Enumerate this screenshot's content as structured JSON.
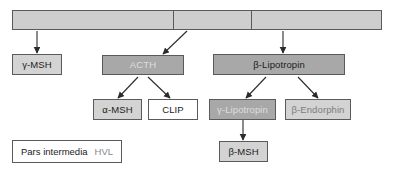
{
  "figure": {
    "background": "#ffffff",
    "border_color": "#5a5a5a"
  },
  "precursor_bar": {
    "name": "pomc-precursor-bar",
    "fill": "#cecece",
    "segments": [
      {
        "label": ""
      },
      {
        "label": ""
      },
      {
        "label": ""
      }
    ]
  },
  "nodes": {
    "gamma_msh": {
      "label": "γ-MSH",
      "fill": "#d3d3d3",
      "text": "#1c1c1c"
    },
    "acth": {
      "label": "ACTH",
      "fill": "#a8a8a8",
      "text": "#dedede"
    },
    "beta_lipotropin": {
      "label": "β-Lipotropin",
      "fill": "#a8a8a8",
      "text": "#1c1c1c"
    },
    "alpha_msh": {
      "label": "α-MSH",
      "fill": "#d3d3d3",
      "text": "#1c1c1c"
    },
    "clip": {
      "label": "CLIP",
      "fill": "#ffffff",
      "text": "#1c1c1c"
    },
    "gamma_lipotropin": {
      "label": "γ-Lipotropin",
      "fill": "#a8a8a8",
      "text": "#dedede"
    },
    "beta_endorphin": {
      "label": "β-Endorphin",
      "fill": "#d3d3d3",
      "text": "#7d7d7d"
    },
    "beta_msh": {
      "label": "β-MSH",
      "fill": "#d3d3d3",
      "text": "#1c1c1c"
    }
  },
  "legend": {
    "pars_intermedia": "Pars intermedia",
    "hvl": "HVL",
    "pars_color": "#1c1c1c",
    "hvl_color": "#8a8a8a"
  },
  "arrows": [
    {
      "name": "arrow-bar-to-gamma-msh",
      "from": "precursor-bar",
      "to": "gamma-msh"
    },
    {
      "name": "arrow-bar-to-acth",
      "from": "precursor-bar",
      "to": "acth"
    },
    {
      "name": "arrow-bar-to-beta-lipotropin",
      "from": "precursor-bar",
      "to": "beta-lipotropin"
    },
    {
      "name": "arrow-acth-to-alpha-msh",
      "from": "acth",
      "to": "alpha-msh"
    },
    {
      "name": "arrow-acth-to-clip",
      "from": "acth",
      "to": "clip"
    },
    {
      "name": "arrow-lipotropin-to-gamma-lipotropin",
      "from": "beta-lipotropin",
      "to": "gamma-lipotropin"
    },
    {
      "name": "arrow-lipotropin-to-beta-endorphin",
      "from": "beta-lipotropin",
      "to": "beta-endorphin"
    },
    {
      "name": "arrow-gamma-lipotropin-to-beta-msh",
      "from": "gamma-lipotropin",
      "to": "beta-msh"
    }
  ]
}
